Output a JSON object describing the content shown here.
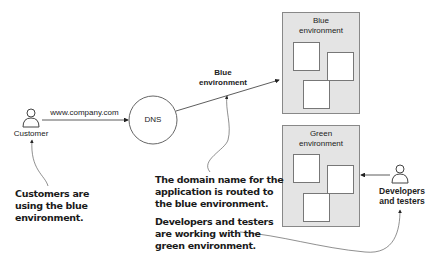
{
  "customer": {
    "label": "Customer",
    "icon": "person-icon"
  },
  "url_label": "www.company.com",
  "dns": {
    "label": "DNS"
  },
  "route_label": {
    "line1": "Blue",
    "line2": "environment"
  },
  "blue_env": {
    "title_line1": "Blue",
    "title_line2": "environment",
    "servers": 3,
    "color": "#e4e4e4"
  },
  "green_env": {
    "title_line1": "Green",
    "title_line2": "environment",
    "servers": 3,
    "color": "#e4e4e4"
  },
  "developers": {
    "line1": "Developers",
    "line2": "and testers",
    "icon": "person-icon"
  },
  "notes": {
    "customers": {
      "line1": "Customers are",
      "line2": "using the blue",
      "line3": "environment."
    },
    "domain": {
      "line1": "The domain name for the",
      "line2": "application is routed to",
      "line3": "the blue environment."
    },
    "developers": {
      "line1": "Developers and testers",
      "line2": "are working with the",
      "line3": "green environment."
    }
  }
}
